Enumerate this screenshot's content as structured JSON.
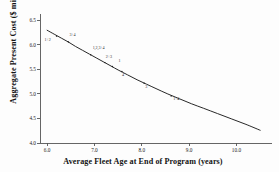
{
  "figure": {
    "background": "#fdfdfd",
    "line_color": "#1c1c1c",
    "axis_color": "#555555"
  },
  "chart_data": {
    "type": "line",
    "title": "",
    "subtitle": "",
    "xlabel": "Average Fleet Age at End of Program (years)",
    "ylabel": "Aggregate Present Cost ($ million)",
    "xlim": [
      5.85,
      10.75
    ],
    "ylim": [
      4.0,
      6.55
    ],
    "grid": false,
    "legend": "none",
    "xticks": [
      "6.0",
      "7.0",
      "8.0",
      "9.0",
      "10.0"
    ],
    "xtick_values": [
      6.0,
      7.0,
      8.0,
      9.0,
      10.0
    ],
    "yticks": [
      "6.5",
      "6.0",
      "5.5",
      "5.0",
      "4.5",
      "4.0"
    ],
    "ytick_values": [
      6.5,
      6.0,
      5.5,
      5.0,
      4.5,
      4.0
    ],
    "series": [
      {
        "name": "Aggregate present cost curve",
        "x": [
          6.0,
          6.15,
          6.3,
          6.45,
          6.6,
          6.75,
          6.9,
          7.05,
          7.2,
          7.35,
          7.5,
          7.7,
          7.9,
          8.1,
          8.3,
          8.55,
          8.8,
          9.05,
          9.3,
          9.6,
          9.9,
          10.2,
          10.5
        ],
        "y": [
          6.3,
          6.22,
          6.14,
          6.06,
          5.97,
          5.89,
          5.81,
          5.73,
          5.65,
          5.57,
          5.49,
          5.39,
          5.29,
          5.2,
          5.11,
          5.0,
          4.9,
          4.8,
          4.71,
          4.6,
          4.49,
          4.38,
          4.26
        ]
      }
    ],
    "annotations": [
      {
        "label": "1+2",
        "x": 6.2,
        "y": 6.18,
        "dx": -12,
        "dy": 4
      },
      {
        "label": "3+4",
        "x": 6.45,
        "y": 6.06,
        "dx": 1,
        "dy": -7
      },
      {
        "label": "1,2,3+4",
        "x": 6.92,
        "y": 5.8,
        "dx": 2,
        "dy": -7
      },
      {
        "label": "2+3",
        "x": 7.22,
        "y": 5.64,
        "dx": 1,
        "dy": -6
      },
      {
        "label": "1",
        "x": 7.38,
        "y": 5.56,
        "dx": 6,
        "dy": -6
      },
      {
        "label": "4",
        "x": 7.58,
        "y": 5.46,
        "dx": 0,
        "dy": 4
      },
      {
        "label": "3",
        "x": 8.05,
        "y": 5.22,
        "dx": 1,
        "dy": 4
      },
      {
        "label": "1+4",
        "x": 8.62,
        "y": 4.96,
        "dx": 2,
        "dy": 3
      }
    ]
  }
}
